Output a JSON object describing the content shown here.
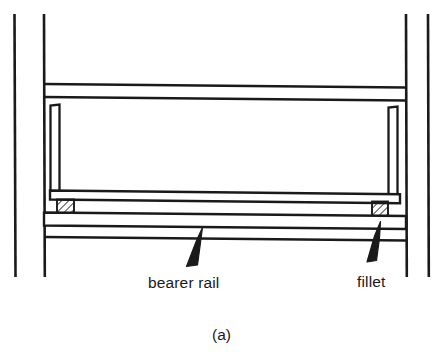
{
  "figure": {
    "caption": "(a)",
    "kind": "engineering-cross-section",
    "background_color": "#ffffff",
    "line_color": "#1a1a1a",
    "hatch_color": "#1a1a1a"
  },
  "labels": {
    "bearer_rail": "bearer rail",
    "fillet": "fillet"
  },
  "annotations": [
    {
      "id": "bearer-rail",
      "text": "bearer rail",
      "text_x": 148,
      "text_y": 282,
      "arrow_tail_x": 188,
      "arrow_tail_y": 265,
      "arrow_tip_x": 199,
      "arrow_tip_y": 228
    },
    {
      "id": "fillet",
      "text": "fillet",
      "text_x": 357,
      "text_y": 281,
      "arrow_tail_x": 368,
      "arrow_tail_y": 262,
      "arrow_tip_x": 379,
      "arrow_tip_y": 222
    }
  ],
  "structure": {
    "outer_posts": [
      {
        "id": "outer-post-left",
        "x": 14,
        "y1": 14,
        "y2": 277
      },
      {
        "id": "outer-post-right",
        "x": 428,
        "y1": 14,
        "y2": 277
      }
    ],
    "frame_posts": [
      {
        "id": "frame-post-left",
        "x": 44,
        "y1": 14,
        "y2": 277
      },
      {
        "id": "frame-post-right",
        "x": 406,
        "y1": 14,
        "y2": 277
      }
    ],
    "top_rail": {
      "id": "top-rail",
      "left_x": 44,
      "right_x": 406,
      "upper_y_left": 84,
      "upper_y_right": 87,
      "lower_y_left": 97,
      "lower_y_right": 100
    },
    "inner_posts": [
      {
        "id": "inner-post-left",
        "x": 50,
        "y_top": 104,
        "width": 9,
        "y_bottom": 192
      },
      {
        "id": "inner-post-right",
        "x": 388,
        "y_top": 106,
        "width": 9,
        "y_bottom": 196
      }
    ],
    "bearer_rail_band": {
      "id": "bearer-rail-band",
      "left_x": 50,
      "right_x": 400,
      "top_y_left": 190,
      "top_y_right": 194,
      "bottom_y_left": 199,
      "bottom_y_right": 203
    },
    "lower_band": {
      "id": "lower-band",
      "left_x": 44,
      "right_x": 406,
      "top_y_left": 212,
      "top_y_right": 215,
      "bottom_y_left": 228,
      "bottom_y_right": 231
    },
    "fillets": [
      {
        "id": "fillet-left",
        "x": 57,
        "y": 199,
        "width": 17,
        "height": 15
      },
      {
        "id": "fillet-right",
        "x": 372,
        "y": 201,
        "width": 16,
        "height": 16
      }
    ]
  }
}
